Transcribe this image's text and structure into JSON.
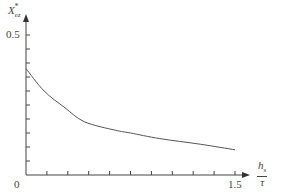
{
  "chart_data": {
    "type": "line",
    "title": "",
    "ylabel": "X*_ez",
    "ylabel_main": "X",
    "ylabel_sup": "*",
    "ylabel_sub": "ez",
    "xlabel": "h_s / τ",
    "xlabel_num": "h",
    "xlabel_num_sub": "s",
    "xlabel_den": "τ",
    "xlim": [
      0,
      1.5
    ],
    "ylim": [
      0,
      0.5
    ],
    "x_ticks": [
      0.15,
      0.3,
      0.45,
      0.6,
      0.75,
      0.9,
      1.05,
      1.2,
      1.35,
      1.5
    ],
    "x_tick_labels": {
      "origin": "0",
      "last": "1.5"
    },
    "y_ticks": [
      0.05,
      0.1,
      0.15,
      0.2,
      0.25,
      0.3,
      0.35,
      0.4,
      0.45,
      0.5
    ],
    "y_tick_labels": {
      "top": "0.5"
    },
    "grid": false,
    "legend": null,
    "series": [
      {
        "name": "X*_ez",
        "color": "#555555",
        "x": [
          0.0,
          0.13,
          0.28,
          0.42,
          0.64,
          0.75,
          0.96,
          1.25,
          1.5
        ],
        "y": [
          0.38,
          0.3,
          0.24,
          0.19,
          0.16,
          0.15,
          0.13,
          0.11,
          0.09
        ]
      }
    ]
  }
}
